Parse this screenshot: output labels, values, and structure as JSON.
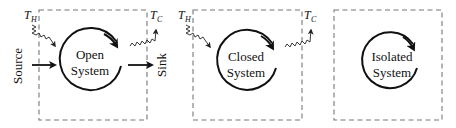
{
  "diagram": {
    "systems": [
      {
        "id": "open",
        "label_line1": "Open",
        "label_line2": "System",
        "hot_label": "T",
        "hot_sub": "H",
        "cold_label": "T",
        "cold_sub": "C",
        "source_label": "Source",
        "sink_label": "Sink"
      },
      {
        "id": "closed",
        "label_line1": "Closed",
        "label_line2": "System",
        "hot_label": "T",
        "hot_sub": "H",
        "cold_label": "T",
        "cold_sub": "C"
      },
      {
        "id": "isolated",
        "label_line1": "Isolated",
        "label_line2": "System"
      }
    ],
    "colors": {
      "boundary": "#777777",
      "ink": "#111111"
    }
  }
}
